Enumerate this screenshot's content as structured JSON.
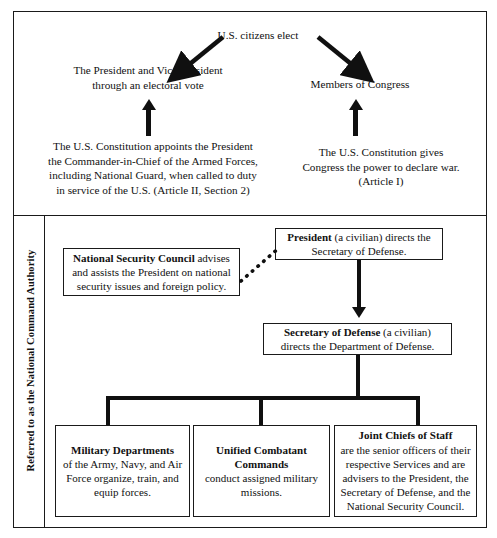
{
  "diagram": {
    "sidebar_label": "Referred to as the National Command Authority",
    "top_section": {
      "source_label": "U.S. citizens elect",
      "elected_left": "The President and Vice-President\nthrough an electoral vote",
      "elected_right": "Members of Congress",
      "basis_left": "The U.S. Constitution appoints the President\nthe Commander-in-Chief of the Armed Forces,\nincluding National Guard, when called to duty\nin service of the U.S. (Article II, Section 2)",
      "basis_right": "The U.S. Constitution gives\nCongress the power to declare war.\n(Article I)"
    },
    "bottom_section": {
      "president": {
        "bold": "President",
        "rest": " (a civilian) directs the Secretary of Defense."
      },
      "nsc": {
        "bold": "National Security Council",
        "rest": " advises and assists the President on national security issues and foreign policy."
      },
      "secdef": {
        "bold": "Secretary of Defense",
        "rest": " (a civilian) directs the Department of Defense."
      },
      "branches": [
        {
          "bold": "Military Departments",
          "rest": "of the Army, Navy, and Air Force organize, train, and equip forces."
        },
        {
          "bold": "Unified Combatant Commands",
          "rest": "conduct assigned military missions."
        },
        {
          "bold": "Joint Chiefs of Staff",
          "rest": "are the senior officers of their respective Services and are advisers to the President, the Secretary of Defense, and the National Security Council."
        }
      ]
    },
    "colors": {
      "line": "#101010",
      "border": "#1a1a1a",
      "background": "#ffffff",
      "text": "#111111"
    }
  }
}
